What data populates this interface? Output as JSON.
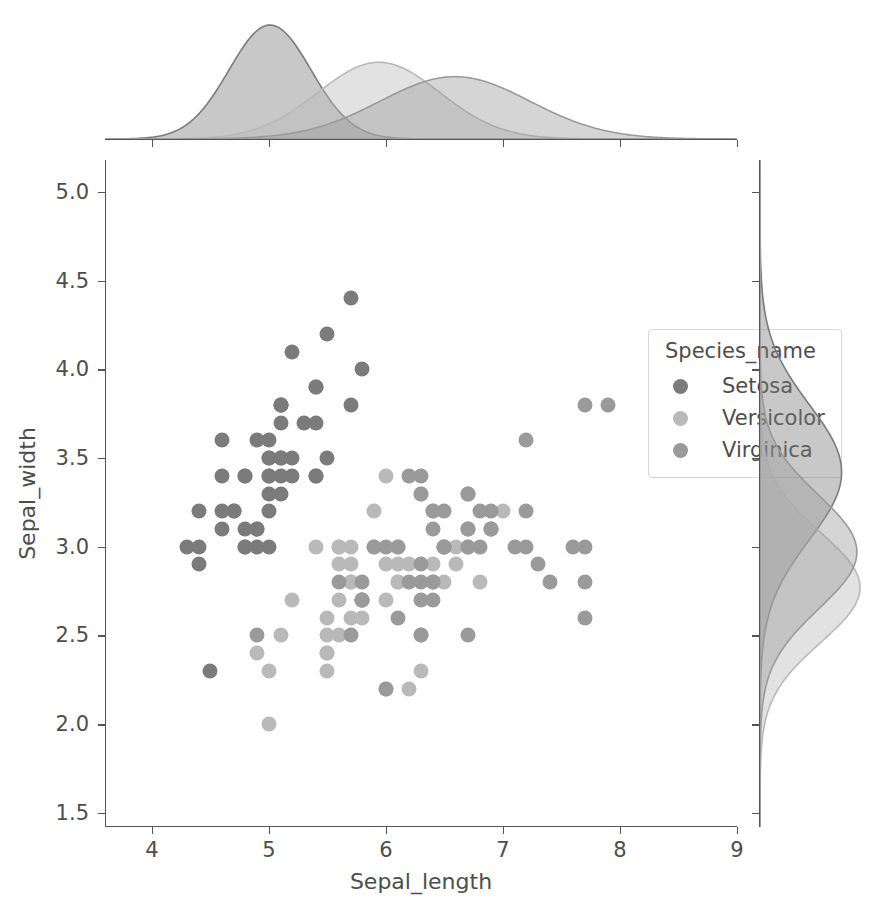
{
  "figure": {
    "width": 884,
    "height": 909,
    "background": "#ffffff",
    "type": "jointplot-scatter-with-marginal-kde"
  },
  "legend": {
    "title": "Species_name",
    "entries": [
      {
        "label": "Setosa",
        "color": "#7b7b7b"
      },
      {
        "label": "Versicolor",
        "color": "#b9b9b9"
      },
      {
        "label": "Virginica",
        "color": "#9a9a9a"
      }
    ]
  },
  "chart_data": {
    "type": "scatter",
    "title": "",
    "xlabel": "Sepal_length",
    "ylabel": "Sepal_width",
    "xlim": [
      3.6,
      9.0
    ],
    "ylim": [
      1.42,
      5.18
    ],
    "xticks": [
      4,
      5,
      6,
      7,
      8,
      9
    ],
    "xticklabels": [
      "4",
      "5",
      "6",
      "7",
      "8",
      "9"
    ],
    "yticks": [
      1.5,
      2.0,
      2.5,
      3.0,
      3.5,
      4.0,
      4.5,
      5.0
    ],
    "yticklabels": [
      "1.5",
      "2.0",
      "2.5",
      "3.0",
      "3.5",
      "4.0",
      "4.5",
      "5.0"
    ],
    "grid": false,
    "legend_position": "upper right",
    "marginal_x": {
      "type": "kde",
      "axis": "x",
      "series": [
        {
          "name": "Setosa",
          "color": "#7b7b7b",
          "mean": 5.01,
          "sd": 0.35,
          "peak": 5.0
        },
        {
          "name": "Versicolor",
          "color": "#b9b9b9",
          "mean": 5.94,
          "sd": 0.52,
          "peak": 5.9
        },
        {
          "name": "Virginica",
          "color": "#9a9a9a",
          "mean": 6.59,
          "sd": 0.64,
          "peak": 6.5
        }
      ]
    },
    "marginal_y": {
      "type": "kde",
      "axis": "y",
      "series": [
        {
          "name": "Setosa",
          "color": "#7b7b7b",
          "mean": 3.42,
          "sd": 0.38,
          "peak": 3.4
        },
        {
          "name": "Versicolor",
          "color": "#b9b9b9",
          "mean": 2.77,
          "sd": 0.31,
          "peak": 2.8
        },
        {
          "name": "Virginica",
          "color": "#9a9a9a",
          "mean": 2.97,
          "sd": 0.32,
          "peak": 3.0
        }
      ]
    },
    "series": [
      {
        "name": "Setosa",
        "color": "#7b7b7b",
        "points": [
          [
            5.1,
            3.5
          ],
          [
            4.9,
            3.0
          ],
          [
            4.7,
            3.2
          ],
          [
            4.6,
            3.1
          ],
          [
            5.0,
            3.6
          ],
          [
            5.4,
            3.9
          ],
          [
            4.6,
            3.4
          ],
          [
            5.0,
            3.4
          ],
          [
            4.4,
            2.9
          ],
          [
            4.9,
            3.1
          ],
          [
            5.4,
            3.7
          ],
          [
            4.8,
            3.4
          ],
          [
            4.8,
            3.0
          ],
          [
            4.3,
            3.0
          ],
          [
            5.8,
            4.0
          ],
          [
            5.7,
            4.4
          ],
          [
            5.4,
            3.9
          ],
          [
            5.1,
            3.5
          ],
          [
            5.7,
            3.8
          ],
          [
            5.1,
            3.8
          ],
          [
            5.4,
            3.4
          ],
          [
            5.1,
            3.7
          ],
          [
            4.6,
            3.6
          ],
          [
            5.1,
            3.3
          ],
          [
            4.8,
            3.4
          ],
          [
            5.0,
            3.0
          ],
          [
            5.0,
            3.4
          ],
          [
            5.2,
            3.5
          ],
          [
            5.2,
            3.4
          ],
          [
            4.7,
            3.2
          ],
          [
            4.8,
            3.1
          ],
          [
            5.4,
            3.4
          ],
          [
            5.2,
            4.1
          ],
          [
            5.5,
            4.2
          ],
          [
            4.9,
            3.1
          ],
          [
            5.0,
            3.2
          ],
          [
            5.5,
            3.5
          ],
          [
            4.9,
            3.6
          ],
          [
            4.4,
            3.0
          ],
          [
            5.1,
            3.4
          ],
          [
            5.0,
            3.5
          ],
          [
            4.5,
            2.3
          ],
          [
            4.4,
            3.2
          ],
          [
            5.0,
            3.5
          ],
          [
            5.1,
            3.8
          ],
          [
            4.8,
            3.0
          ],
          [
            5.1,
            3.8
          ],
          [
            4.6,
            3.2
          ],
          [
            5.3,
            3.7
          ],
          [
            5.0,
            3.3
          ]
        ]
      },
      {
        "name": "Versicolor",
        "color": "#b9b9b9",
        "points": [
          [
            7.0,
            3.2
          ],
          [
            6.4,
            3.2
          ],
          [
            6.9,
            3.1
          ],
          [
            5.5,
            2.3
          ],
          [
            6.5,
            2.8
          ],
          [
            5.7,
            2.8
          ],
          [
            6.3,
            3.3
          ],
          [
            4.9,
            2.4
          ],
          [
            6.6,
            2.9
          ],
          [
            5.2,
            2.7
          ],
          [
            5.0,
            2.0
          ],
          [
            5.9,
            3.0
          ],
          [
            6.0,
            2.2
          ],
          [
            6.1,
            2.9
          ],
          [
            5.6,
            2.9
          ],
          [
            6.7,
            3.1
          ],
          [
            5.6,
            3.0
          ],
          [
            5.8,
            2.7
          ],
          [
            6.2,
            2.2
          ],
          [
            5.6,
            2.5
          ],
          [
            5.9,
            3.2
          ],
          [
            6.1,
            2.8
          ],
          [
            6.3,
            2.5
          ],
          [
            6.1,
            2.8
          ],
          [
            6.4,
            2.9
          ],
          [
            6.6,
            3.0
          ],
          [
            6.8,
            2.8
          ],
          [
            6.7,
            3.0
          ],
          [
            6.0,
            2.9
          ],
          [
            5.7,
            2.6
          ],
          [
            5.5,
            2.4
          ],
          [
            5.5,
            2.4
          ],
          [
            5.8,
            2.7
          ],
          [
            6.0,
            2.7
          ],
          [
            5.4,
            3.0
          ],
          [
            6.0,
            3.4
          ],
          [
            6.7,
            3.1
          ],
          [
            6.3,
            2.3
          ],
          [
            5.6,
            3.0
          ],
          [
            5.5,
            2.5
          ],
          [
            5.5,
            2.6
          ],
          [
            6.1,
            3.0
          ],
          [
            5.8,
            2.6
          ],
          [
            5.0,
            2.3
          ],
          [
            5.6,
            2.7
          ],
          [
            5.7,
            3.0
          ],
          [
            5.7,
            2.9
          ],
          [
            6.2,
            2.9
          ],
          [
            5.1,
            2.5
          ],
          [
            5.7,
            2.8
          ]
        ]
      },
      {
        "name": "Virginica",
        "color": "#9a9a9a",
        "points": [
          [
            6.3,
            3.3
          ],
          [
            5.8,
            2.7
          ],
          [
            7.1,
            3.0
          ],
          [
            6.3,
            2.9
          ],
          [
            6.5,
            3.0
          ],
          [
            7.6,
            3.0
          ],
          [
            4.9,
            2.5
          ],
          [
            7.3,
            2.9
          ],
          [
            6.7,
            2.5
          ],
          [
            7.2,
            3.6
          ],
          [
            6.5,
            3.2
          ],
          [
            6.4,
            2.7
          ],
          [
            6.8,
            3.0
          ],
          [
            5.7,
            2.5
          ],
          [
            5.8,
            2.8
          ],
          [
            6.4,
            3.2
          ],
          [
            6.5,
            3.0
          ],
          [
            7.7,
            3.8
          ],
          [
            7.7,
            2.6
          ],
          [
            6.0,
            2.2
          ],
          [
            6.9,
            3.2
          ],
          [
            5.6,
            2.8
          ],
          [
            7.7,
            2.8
          ],
          [
            6.3,
            2.7
          ],
          [
            6.7,
            3.3
          ],
          [
            7.2,
            3.2
          ],
          [
            6.2,
            2.8
          ],
          [
            6.1,
            3.0
          ],
          [
            6.4,
            2.8
          ],
          [
            7.2,
            3.0
          ],
          [
            7.4,
            2.8
          ],
          [
            7.9,
            3.8
          ],
          [
            6.4,
            2.8
          ],
          [
            6.3,
            2.8
          ],
          [
            6.1,
            2.6
          ],
          [
            7.7,
            3.0
          ],
          [
            6.3,
            3.4
          ],
          [
            6.4,
            3.1
          ],
          [
            6.0,
            3.0
          ],
          [
            6.9,
            3.1
          ],
          [
            6.7,
            3.1
          ],
          [
            6.9,
            3.1
          ],
          [
            5.8,
            2.7
          ],
          [
            6.8,
            3.2
          ],
          [
            6.7,
            3.3
          ],
          [
            6.7,
            3.0
          ],
          [
            6.3,
            2.5
          ],
          [
            6.5,
            3.0
          ],
          [
            6.2,
            3.4
          ],
          [
            5.9,
            3.0
          ]
        ]
      }
    ]
  }
}
